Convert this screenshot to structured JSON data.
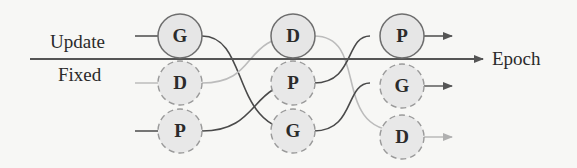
{
  "labels": {
    "update": "Update",
    "fixed": "Fixed",
    "axis": "Epoch"
  },
  "colors": {
    "background": "#f7f7f5",
    "node_fill": "#e6e6e6",
    "node_stroke_update": "#6e6e6e",
    "node_stroke_fixed": "#9a9a9a",
    "dark_link": "#4a4a4a",
    "light_link": "#b8b8b8",
    "axis": "#555555"
  },
  "columns": [
    {
      "nodes": [
        {
          "label": "G",
          "state": "update"
        },
        {
          "label": "D",
          "state": "fixed"
        },
        {
          "label": "P",
          "state": "fixed"
        }
      ]
    },
    {
      "nodes": [
        {
          "label": "D",
          "state": "update"
        },
        {
          "label": "P",
          "state": "fixed"
        },
        {
          "label": "G",
          "state": "fixed"
        }
      ]
    },
    {
      "nodes": [
        {
          "label": "P",
          "state": "update"
        },
        {
          "label": "G",
          "state": "fixed"
        },
        {
          "label": "D",
          "state": "fixed"
        }
      ]
    }
  ]
}
